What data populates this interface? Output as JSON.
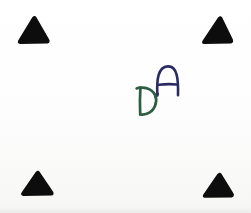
{
  "image": {
    "kind": "scanned-paper-photo",
    "description": "White paper sheet with four solid black triangular fiducial markers at the corners and two handwritten letters near the centre",
    "background_color": "#fefefe",
    "width": 251,
    "height": 213
  },
  "markers": {
    "shape": "triangle",
    "fill_color": "#0d0d0d",
    "count": 4,
    "items": [
      {
        "id": "top-left",
        "name": "corner-marker-top-left",
        "x": 17,
        "y": 15,
        "width": 34,
        "height": 30,
        "rotation": 0
      },
      {
        "id": "top-right",
        "name": "corner-marker-top-right",
        "x": 201,
        "y": 15,
        "width": 33,
        "height": 30,
        "rotation": 0
      },
      {
        "id": "bottom-left",
        "name": "corner-marker-bottom-left",
        "x": 20,
        "y": 170,
        "width": 35,
        "height": 27,
        "rotation": 0
      },
      {
        "id": "bottom-right",
        "name": "corner-marker-bottom-right",
        "x": 202,
        "y": 172,
        "width": 33,
        "height": 27,
        "rotation": 0
      }
    ]
  },
  "handwriting": {
    "text": "DA",
    "letters": [
      {
        "id": "letter-a",
        "glyph": "A",
        "color": "#2b2b63",
        "ink": "dark navy blue pen",
        "x": 154,
        "y": 64,
        "width": 28,
        "height": 33
      },
      {
        "id": "letter-d",
        "glyph": "D",
        "color": "#2f5d43",
        "ink": "dark green pen",
        "x": 134,
        "y": 85,
        "width": 28,
        "height": 32
      }
    ]
  }
}
